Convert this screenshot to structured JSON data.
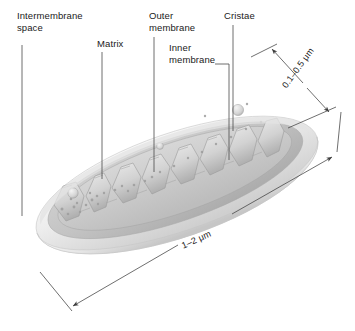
{
  "figure": {
    "background_color": "#ffffff",
    "line_color": "#3c3c3c",
    "text_color": "#1a1a1a",
    "body_fill_light": "#f2f2f2",
    "body_fill_mid": "#d8d8d8",
    "body_fill_dark": "#b9b9b9"
  },
  "labels": {
    "intermembrane_space": "Intermembrane\nspace",
    "matrix": "Matrix",
    "outer_membrane": "Outer\nmembrane",
    "inner_membrane": "Inner\nmembrane",
    "cristae": "Cristae"
  },
  "dimensions": {
    "thickness": "0.1–0.5 μm",
    "length": "1–2 μm"
  }
}
